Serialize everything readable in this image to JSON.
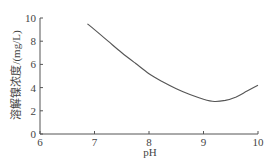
{
  "chart_data": {
    "type": "line",
    "title": "",
    "xlabel": "pH",
    "ylabel": "溶解镍浓度/(mg/L)",
    "xlim": [
      6,
      10
    ],
    "ylim": [
      0,
      10
    ],
    "xticks": [
      6,
      7,
      8,
      9,
      10
    ],
    "yticks": [
      0,
      2,
      4,
      6,
      8,
      10
    ],
    "grid": false,
    "legend": null,
    "series": [
      {
        "name": "溶解镍浓度",
        "x": [
          6.87,
          7.0,
          7.25,
          7.5,
          7.75,
          8.0,
          8.25,
          8.5,
          8.75,
          9.0,
          9.2,
          9.4,
          9.6,
          9.8,
          10.0
        ],
        "values": [
          9.5,
          9.0,
          8.0,
          7.0,
          6.1,
          5.2,
          4.5,
          3.9,
          3.4,
          3.0,
          2.8,
          2.9,
          3.2,
          3.7,
          4.2
        ]
      }
    ],
    "colors": {
      "line": "#555555",
      "axis": "#555555"
    }
  }
}
